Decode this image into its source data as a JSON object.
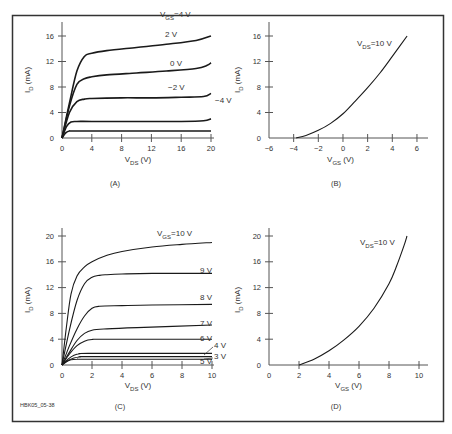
{
  "figure": {
    "id_label": "HBK05_05-38",
    "frame_color": "#333333",
    "line_color": "#1a1a1a"
  },
  "chart_data": [
    {
      "panel": "(A)",
      "type": "line",
      "title": "",
      "xlabel": "V_DS (V)",
      "ylabel": "I_D (mA)",
      "xlim": [
        0,
        20
      ],
      "ylim": [
        0,
        16
      ],
      "xticks": [
        0,
        4,
        8,
        12,
        16,
        20
      ],
      "yticks": [
        0,
        4,
        8,
        12,
        16
      ],
      "grid": false,
      "series": [
        {
          "name": "VGS=4 V",
          "label": "V_GS=4 V",
          "x": [
            0,
            1,
            2,
            3,
            4,
            6,
            10,
            14,
            18,
            20
          ],
          "y": [
            0,
            5.5,
            10.5,
            12.8,
            13.3,
            13.7,
            14.2,
            14.7,
            15.3,
            16
          ]
        },
        {
          "name": "2 V",
          "label": "2 V",
          "x": [
            0,
            1,
            2,
            3,
            4,
            6,
            10,
            14,
            18,
            19.5,
            20
          ],
          "y": [
            0,
            5,
            8.4,
            9.3,
            9.6,
            9.9,
            10.2,
            10.5,
            10.9,
            11.4,
            11.8
          ]
        },
        {
          "name": "0 V",
          "label": "0 V",
          "x": [
            0,
            1,
            2,
            3,
            4,
            8,
            12,
            16,
            19,
            20
          ],
          "y": [
            0,
            4,
            5.7,
            6.1,
            6.2,
            6.3,
            6.3,
            6.4,
            6.5,
            7
          ]
        },
        {
          "name": "-2 V",
          "label": "−2 V",
          "x": [
            0,
            0.6,
            1.2,
            2,
            4,
            10,
            16,
            19,
            20
          ],
          "y": [
            0,
            1.8,
            2.5,
            2.6,
            2.6,
            2.6,
            2.6,
            2.7,
            3
          ]
        },
        {
          "name": "-4 V",
          "label": "−4 V",
          "x": [
            0,
            0.5,
            1,
            2,
            10,
            20
          ],
          "y": [
            0,
            0.8,
            1.1,
            1.1,
            1.1,
            1.1
          ]
        }
      ]
    },
    {
      "panel": "(B)",
      "type": "line",
      "title": "",
      "xlabel": "V_GS (V)",
      "ylabel": "I_D (mA)",
      "xlim": [
        -6,
        6
      ],
      "ylim": [
        0,
        16
      ],
      "xticks": [
        -6,
        -4,
        -2,
        0,
        2,
        4,
        6
      ],
      "yticks": [
        0,
        4,
        8,
        12,
        16
      ],
      "grid": false,
      "annotation": "V_DS=10 V",
      "series": [
        {
          "name": "VDS=10 V",
          "x": [
            -3.8,
            -3,
            -2,
            -1,
            0,
            1,
            2,
            3,
            4,
            5.2
          ],
          "y": [
            0,
            0.4,
            1.2,
            2.3,
            3.8,
            5.8,
            7.9,
            10.2,
            12.8,
            16
          ]
        }
      ]
    },
    {
      "panel": "(C)",
      "type": "line",
      "title": "",
      "xlabel": "V_DS (V)",
      "ylabel": "I_D (mA)",
      "xlim": [
        0,
        10
      ],
      "ylim": [
        0,
        20
      ],
      "xticks": [
        0,
        2,
        4,
        6,
        8,
        10
      ],
      "yticks": [
        0,
        4,
        8,
        12,
        16,
        20
      ],
      "grid": false,
      "series": [
        {
          "name": "VGS=10 V",
          "label": "V_GS=10 V",
          "x": [
            0,
            0.3,
            0.6,
            1,
            1.5,
            2,
            3,
            4,
            6,
            8,
            10
          ],
          "y": [
            0,
            6,
            11,
            13.8,
            15.2,
            16,
            17,
            17.6,
            18.3,
            18.7,
            19
          ]
        },
        {
          "name": "9 V",
          "label": "9 V",
          "x": [
            0,
            0.5,
            1,
            1.5,
            2,
            2.5,
            3,
            4,
            6,
            10
          ],
          "y": [
            0,
            5.5,
            10,
            12.6,
            13.6,
            13.9,
            14,
            14.1,
            14.2,
            14.2
          ]
        },
        {
          "name": "8 V",
          "label": "8 V",
          "x": [
            0,
            0.5,
            1,
            1.5,
            2,
            2.5,
            4,
            6,
            10
          ],
          "y": [
            0,
            3,
            5.6,
            7.6,
            8.8,
            9.1,
            9.2,
            9.3,
            9.4
          ]
        },
        {
          "name": "7 V",
          "label": "7 V",
          "x": [
            0,
            0.5,
            1,
            1.5,
            2,
            3,
            5,
            10
          ],
          "y": [
            0,
            2,
            3.8,
            4.9,
            5.4,
            5.6,
            5.8,
            6.2
          ]
        },
        {
          "name": "6 V",
          "label": "6 V",
          "x": [
            0,
            0.5,
            1,
            1.5,
            2,
            3,
            10
          ],
          "y": [
            0,
            1.7,
            3,
            3.7,
            3.95,
            4,
            4
          ]
        },
        {
          "name": "5 V",
          "label": "5 V",
          "x": [
            0,
            0.4,
            0.8,
            1.2,
            2,
            10
          ],
          "y": [
            0,
            0.9,
            1.5,
            1.75,
            1.8,
            1.8
          ]
        },
        {
          "name": "4 V",
          "label": "4 V",
          "x": [
            0,
            0.4,
            0.8,
            1.2,
            2,
            10
          ],
          "y": [
            0,
            0.7,
            1.1,
            1.25,
            1.3,
            1.3
          ]
        },
        {
          "name": "3 V",
          "label": "3 V",
          "x": [
            0,
            0.3,
            0.6,
            1,
            2,
            10
          ],
          "y": [
            0,
            0.5,
            0.8,
            0.9,
            0.9,
            0.9
          ]
        }
      ]
    },
    {
      "panel": "(D)",
      "type": "line",
      "title": "",
      "xlabel": "V_GS (V)",
      "ylabel": "I_D (mA)",
      "xlim": [
        0,
        10
      ],
      "ylim": [
        0,
        20
      ],
      "xticks": [
        0,
        2,
        4,
        6,
        8,
        10
      ],
      "yticks": [
        0,
        4,
        8,
        12,
        16,
        20
      ],
      "grid": false,
      "annotation": "V_DS=10 V",
      "series": [
        {
          "name": "VDS=10 V",
          "x": [
            2,
            3,
            4,
            5,
            6,
            7,
            8,
            8.5,
            9,
            9.2
          ],
          "y": [
            0,
            0.9,
            2.2,
            3.9,
            6,
            8.8,
            12.6,
            15.3,
            18.5,
            20
          ]
        }
      ]
    }
  ]
}
